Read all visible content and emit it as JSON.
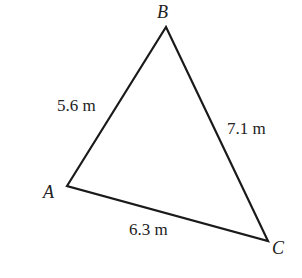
{
  "diagram": {
    "type": "triangle",
    "vertices": {
      "A": {
        "label": "A",
        "x": 67,
        "y": 186
      },
      "B": {
        "label": "B",
        "x": 166,
        "y": 27
      },
      "C": {
        "label": "C",
        "x": 268,
        "y": 241
      }
    },
    "sides": {
      "AB": {
        "label": "5.6 m",
        "length": 5.6,
        "unit": "m"
      },
      "BC": {
        "label": "7.1 m",
        "length": 7.1,
        "unit": "m"
      },
      "AC": {
        "label": "6.3 m",
        "length": 6.3,
        "unit": "m"
      }
    },
    "colors": {
      "stroke": "#1a1a1a",
      "text": "#222222",
      "background": "#ffffff"
    }
  }
}
